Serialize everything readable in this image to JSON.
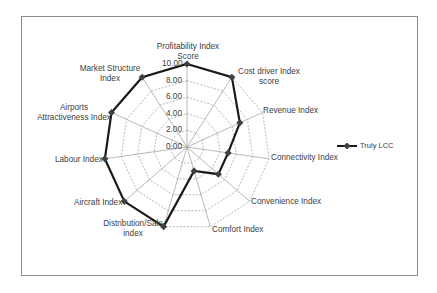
{
  "chart_data": {
    "type": "radar",
    "title": "",
    "categories": [
      "Profitability Index Score",
      "Cost driver Index score",
      "Revenue Index",
      "Connectivity Index",
      "Convenience Index",
      "Comfort Index",
      "Distribution/Sale index",
      "Aircraft Index",
      "Labour  Index",
      "Airports Attractiveness Index",
      "Market Structure Index"
    ],
    "series": [
      {
        "name": "Truly LCC",
        "values": [
          10,
          10,
          7,
          5,
          5,
          3,
          10,
          10,
          10,
          10,
          10
        ],
        "color": "#1a1a1a"
      }
    ],
    "rlim": [
      0,
      10
    ],
    "ticks": [
      "0.00",
      "2.00",
      "4.00",
      "6.00",
      "8.00",
      "10.00"
    ],
    "grid": true,
    "legend_position": "right"
  },
  "labels": {
    "profitability": [
      "Profitability Index",
      "Score"
    ],
    "cost_driver": [
      "Cost driver Index",
      "score"
    ],
    "revenue": "Revenue Index",
    "connectivity": "Connectivity Index",
    "convenience": "Convenience Index",
    "comfort": "Comfort Index",
    "distribution": [
      "Distribution/Sale",
      "index"
    ],
    "aircraft": "Aircraft Index",
    "labour": "Labour  Index",
    "airports": [
      "Airports",
      "Attractiveness Index"
    ],
    "market": [
      "Market Structure",
      "Index"
    ]
  },
  "legend": {
    "label": "Truly LCC"
  }
}
